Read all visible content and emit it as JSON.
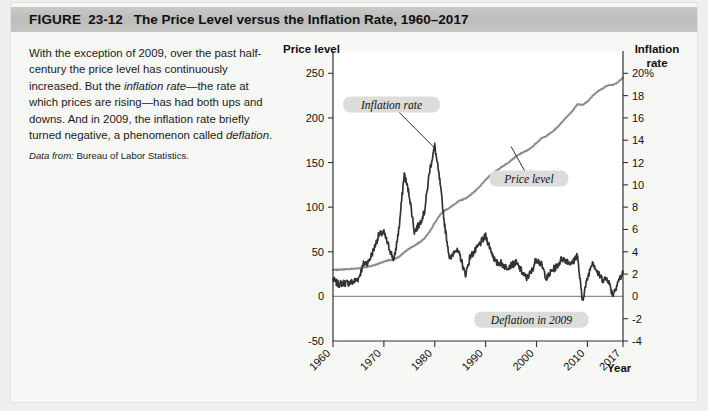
{
  "figure": {
    "label": "FIGURE",
    "number": "23-12",
    "title": "The Price Level versus the Inflation Rate, 1960–2017"
  },
  "caption": {
    "part1": "With the exception of 2009, over the past half-century the price level has continuously increased. But the ",
    "em1": "inflation rate",
    "part2": "—the rate at which prices are rising—has had both ups and downs. And in 2009, the inflation rate briefly turned negative, a phenomenon called ",
    "em2": "deflation",
    "part3": ".",
    "source_lead": "Data from:",
    "source_text": " Bureau of Labor Statistics."
  },
  "chart_data": {
    "type": "line",
    "title": "The Price Level versus the Inflation Rate, 1960–2017",
    "xlabel": "Year",
    "ylabel_left": "Price level",
    "ylabel_right": "Inflation rate",
    "xlim": [
      1960,
      2017
    ],
    "xticks": [
      "1960",
      "1970",
      "1980",
      "1990",
      "2000",
      "2010",
      "2017"
    ],
    "xtick_values": [
      1960,
      1970,
      1980,
      1990,
      2000,
      2010,
      2017
    ],
    "ylim_left": [
      -50,
      275
    ],
    "yticks_left": [
      "250",
      "200",
      "150",
      "100",
      "50",
      "0",
      "-50"
    ],
    "ytick_values_left": [
      250,
      200,
      150,
      100,
      50,
      0,
      -50
    ],
    "ylim_right": [
      -4,
      22
    ],
    "yticks_right": [
      "20%",
      "18",
      "16",
      "14",
      "12",
      "10",
      "8",
      "6",
      "4",
      "2",
      "0",
      "-2",
      "-4"
    ],
    "ytick_values_right": [
      20,
      18,
      16,
      14,
      12,
      10,
      8,
      6,
      4,
      2,
      0,
      -2,
      -4
    ],
    "grid": false,
    "legend_position": "annotations",
    "annotations": [
      {
        "label": "Inflation rate",
        "x": 1973.5,
        "y_right": 14.0
      },
      {
        "label": "Price level",
        "x": 1997.0,
        "y_left": 139.0
      },
      {
        "label": "Deflation in 2009",
        "x": 2002.5,
        "y_right": -2.0
      }
    ],
    "colors": {
      "price_level": "#8d8d8d",
      "inflation_rate": "#333333",
      "zero_line": "#8d8d8d",
      "axis": "#333333",
      "header_band": "#c3c3c1",
      "figure_background": "#f7f7f5",
      "callout_background": "#dcdcda"
    },
    "series": [
      {
        "name": "Price level",
        "axis": "left",
        "x": [
          1960,
          1961,
          1962,
          1963,
          1964,
          1965,
          1966,
          1967,
          1968,
          1969,
          1970,
          1971,
          1972,
          1973,
          1974,
          1975,
          1976,
          1977,
          1978,
          1979,
          1980,
          1981,
          1982,
          1983,
          1984,
          1985,
          1986,
          1987,
          1988,
          1989,
          1990,
          1991,
          1992,
          1993,
          1994,
          1995,
          1996,
          1997,
          1998,
          1999,
          2000,
          2001,
          2002,
          2003,
          2004,
          2005,
          2006,
          2007,
          2008,
          2009,
          2010,
          2011,
          2012,
          2013,
          2014,
          2015,
          2016,
          2017
        ],
        "values": [
          29.6,
          29.9,
          30.2,
          30.6,
          31.0,
          31.5,
          32.4,
          33.4,
          34.8,
          36.7,
          38.8,
          40.5,
          41.8,
          44.4,
          49.3,
          53.8,
          56.9,
          60.6,
          65.2,
          72.6,
          82.4,
          90.9,
          96.5,
          99.6,
          103.9,
          107.6,
          109.6,
          113.6,
          118.3,
          124.0,
          130.7,
          136.2,
          140.3,
          144.5,
          148.2,
          152.4,
          156.9,
          160.5,
          163.0,
          166.6,
          172.2,
          177.1,
          179.9,
          184.0,
          188.9,
          195.3,
          201.6,
          207.3,
          215.3,
          214.5,
          218.1,
          224.9,
          229.6,
          233.0,
          236.7,
          237.0,
          240.0,
          245.1
        ]
      },
      {
        "name": "Inflation rate",
        "axis": "right",
        "x": [
          1960,
          1961,
          1962,
          1963,
          1964,
          1965,
          1966,
          1967,
          1968,
          1969,
          1970,
          1971,
          1972,
          1973,
          1974,
          1975,
          1976,
          1977,
          1978,
          1979,
          1980,
          1981,
          1982,
          1983,
          1984,
          1985,
          1986,
          1987,
          1988,
          1989,
          1990,
          1991,
          1992,
          1993,
          1994,
          1995,
          1996,
          1997,
          1998,
          1999,
          2000,
          2001,
          2002,
          2003,
          2004,
          2005,
          2006,
          2007,
          2008,
          2009,
          2010,
          2011,
          2012,
          2013,
          2014,
          2015,
          2016,
          2017
        ],
        "values": [
          1.5,
          1.1,
          1.2,
          1.2,
          1.3,
          1.6,
          2.9,
          3.1,
          4.2,
          5.5,
          5.7,
          4.4,
          3.2,
          6.2,
          11.0,
          9.1,
          5.8,
          6.5,
          7.6,
          11.3,
          13.5,
          10.3,
          6.2,
          3.2,
          4.3,
          3.6,
          1.9,
          3.6,
          4.1,
          4.8,
          5.4,
          4.2,
          3.0,
          3.0,
          2.6,
          2.8,
          3.0,
          2.3,
          1.6,
          2.2,
          3.4,
          2.8,
          1.6,
          2.3,
          2.7,
          3.4,
          3.2,
          2.9,
          3.8,
          -0.4,
          1.6,
          3.2,
          2.1,
          1.5,
          1.6,
          0.1,
          1.3,
          2.1
        ]
      }
    ]
  }
}
